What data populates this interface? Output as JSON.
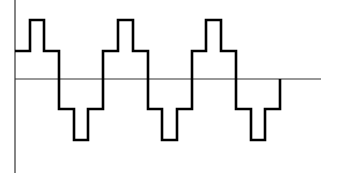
{
  "diagram": {
    "type": "stepped-waveform",
    "colors": {
      "background": "#ffffff",
      "axis": "#333333",
      "waveform": "#000000"
    },
    "levels": [
      2,
      1,
      0,
      -1,
      -2
    ],
    "periods_shown": 2.5,
    "axis": {
      "vertical_x": 15,
      "y_top": 0,
      "y_bottom": 173,
      "horizontal_y": 79,
      "x_start": 15,
      "x_end": 321
    },
    "waveform_points": "15,51 30,51 30,20 44,20 44,51 59,51 59,109 74,109 74,140 88,140 88,109 103,109 103,51 118,51 118,20 133,20 133,51 148,51 148,109 162,109 162,140 177,140 177,109 192,109 192,51 206,51 206,20 221,20 221,51 236,51 236,109 251,109 251,140 265,140 265,109 280,109 280,79"
  }
}
